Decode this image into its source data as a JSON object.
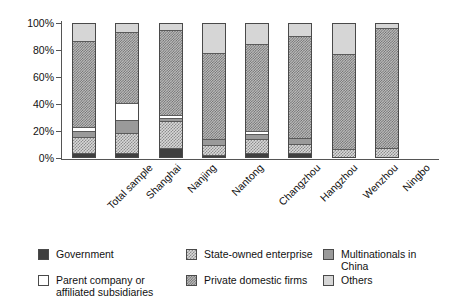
{
  "chart_data": {
    "type": "bar",
    "title": "",
    "subtitle": "",
    "xlabel": "",
    "ylabel": "",
    "stacked": true,
    "stack_mode": "percent",
    "grid": false,
    "legend_position": "bottom",
    "ylim": [
      0,
      100
    ],
    "ytick_labels": [
      "0%",
      "20%",
      "40%",
      "60%",
      "80%",
      "100%"
    ],
    "ytick_values": [
      0,
      20,
      40,
      60,
      80,
      100
    ],
    "categories": [
      "Total sample",
      "Shanghai",
      "Nanjing",
      "Nantong",
      "Changzhou",
      "Hangzhou",
      "Wenzhou",
      "Ningbo"
    ],
    "series": [
      {
        "name": "Government",
        "pattern": "solid-dark",
        "values": [
          2.0,
          2.0,
          6.0,
          1.0,
          2.0,
          2.0,
          0.0,
          0.0
        ]
      },
      {
        "name": "State-owned enterprise",
        "pattern": "light-checker",
        "values": [
          12.0,
          15.0,
          20.5,
          7.5,
          10.5,
          7.0,
          5.0,
          6.0
        ]
      },
      {
        "name": "Multinationals in China",
        "pattern": "solid-gray",
        "values": [
          4.5,
          10.0,
          2.0,
          4.0,
          4.0,
          4.5,
          0.0,
          0.0
        ]
      },
      {
        "name": "Parent company or affiliated subsidiaries",
        "pattern": "white",
        "values": [
          3.0,
          12.5,
          2.0,
          0.0,
          2.0,
          0.0,
          0.0,
          0.0
        ]
      },
      {
        "name": "Private domestic firms",
        "pattern": "dark-checker",
        "values": [
          65.0,
          54.0,
          64.5,
          65.0,
          65.5,
          77.0,
          72.0,
          90.0
        ]
      },
      {
        "name": "Others",
        "pattern": "light-solid",
        "values": [
          13.5,
          6.5,
          5.0,
          22.5,
          16.0,
          9.5,
          23.0,
          4.0
        ]
      }
    ]
  },
  "legend": {
    "entries": [
      {
        "label": "Government",
        "pattern": "solid-dark"
      },
      {
        "label": "State-owned enterprise",
        "pattern": "light-checker"
      },
      {
        "label": "Multinationals in China",
        "pattern": "solid-gray"
      },
      {
        "label": "Parent company or\naffiliated subsidiaries",
        "pattern": "white"
      },
      {
        "label": "Private domestic firms",
        "pattern": "dark-checker"
      },
      {
        "label": "Others",
        "pattern": "light-solid"
      }
    ]
  },
  "colors": {
    "government": "#3f3f3f",
    "state_owned": "#d8d8d8",
    "multinationals": "#9a9a9a",
    "parent_company": "#ffffff",
    "private_domestic": "#bdbdbd",
    "others": "#d6d6d6",
    "axis": "#555555"
  }
}
